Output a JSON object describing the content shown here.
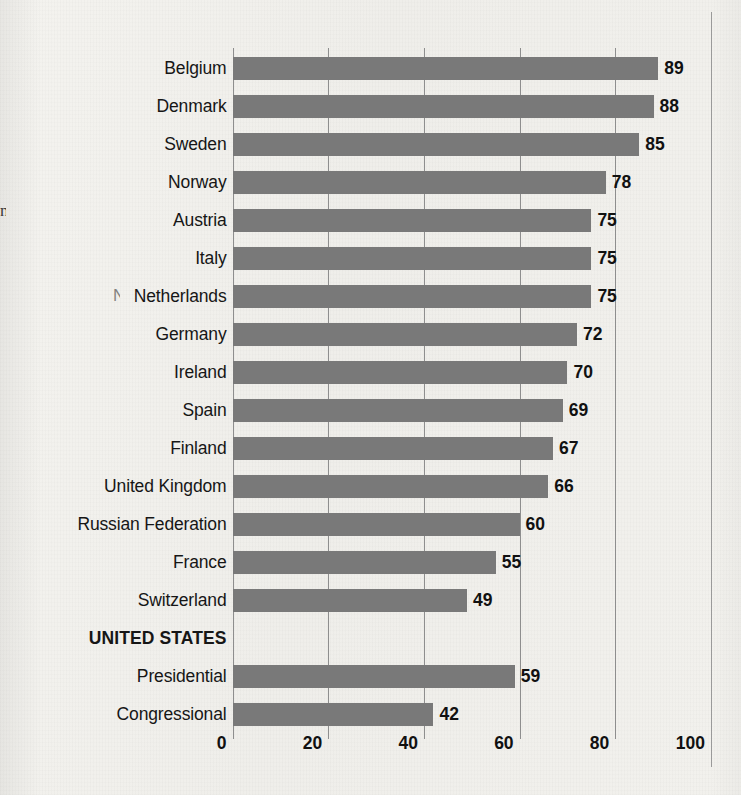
{
  "chart_data": {
    "type": "bar",
    "orientation": "horizontal",
    "title": "",
    "subtitle": "",
    "xlabel": "",
    "ylabel": "",
    "xlim": [
      0,
      100
    ],
    "xticks": [
      0,
      20,
      40,
      60,
      80,
      100
    ],
    "xtick_labels": [
      "0",
      "20",
      "40",
      "60",
      "80",
      "100"
    ],
    "grid": true,
    "legend": null,
    "bar_color": "#797979",
    "paper_color": "#f1f0ec",
    "text_color": "#111111",
    "categories": [
      "Belgium",
      "Denmark",
      "Sweden",
      "Norway",
      "Austria",
      "Italy",
      "Netherlands",
      "Germany",
      "Ireland",
      "Spain",
      "Finland",
      "United Kingdom",
      "Russian Federation",
      "Switzerland",
      "France",
      "UNITED STATES",
      "Presidential",
      "Congressional"
    ],
    "values": [
      89,
      88,
      85,
      78,
      75,
      75,
      75,
      72,
      70,
      69,
      67,
      66,
      60,
      55,
      49,
      null,
      59,
      42
    ],
    "rows": [
      {
        "label": "Belgium",
        "value": 89,
        "value_label": "89",
        "is_heading": false,
        "has_bar": true
      },
      {
        "label": "Denmark",
        "value": 88,
        "value_label": "88",
        "is_heading": false,
        "has_bar": true
      },
      {
        "label": "Sweden",
        "value": 85,
        "value_label": "85",
        "is_heading": false,
        "has_bar": true
      },
      {
        "label": "Norway",
        "value": 78,
        "value_label": "78",
        "is_heading": false,
        "has_bar": true
      },
      {
        "label": "Austria",
        "value": 75,
        "value_label": "75",
        "is_heading": false,
        "has_bar": true
      },
      {
        "label": "Italy",
        "value": 75,
        "value_label": "75",
        "is_heading": false,
        "has_bar": true
      },
      {
        "label": "Netherlands",
        "value": 75,
        "value_label": "75",
        "is_heading": false,
        "has_bar": true
      },
      {
        "label": "Germany",
        "value": 72,
        "value_label": "72",
        "is_heading": false,
        "has_bar": true
      },
      {
        "label": "Ireland",
        "value": 70,
        "value_label": "70",
        "is_heading": false,
        "has_bar": true
      },
      {
        "label": "Spain",
        "value": 69,
        "value_label": "69",
        "is_heading": false,
        "has_bar": true
      },
      {
        "label": "Finland",
        "value": 67,
        "value_label": "67",
        "is_heading": false,
        "has_bar": true
      },
      {
        "label": "United Kingdom",
        "value": 66,
        "value_label": "66",
        "is_heading": false,
        "has_bar": true
      },
      {
        "label": "Russian Federation",
        "value": 60,
        "value_label": "60",
        "is_heading": false,
        "has_bar": true
      },
      {
        "label": "France",
        "value": 55,
        "value_label": "55",
        "is_heading": false,
        "has_bar": true
      },
      {
        "label": "Switzerland",
        "value": 49,
        "value_label": "49",
        "is_heading": false,
        "has_bar": true
      },
      {
        "label": "UNITED STATES",
        "value": null,
        "value_label": "",
        "is_heading": true,
        "has_bar": false
      },
      {
        "label": "Presidential",
        "value": 59,
        "value_label": "59",
        "is_heading": false,
        "has_bar": true
      },
      {
        "label": "Congressional",
        "value": 42,
        "value_label": "42",
        "is_heading": false,
        "has_bar": true
      }
    ]
  },
  "page_bleed": {
    "left_glyph": "n",
    "mid_glyph": "N"
  }
}
